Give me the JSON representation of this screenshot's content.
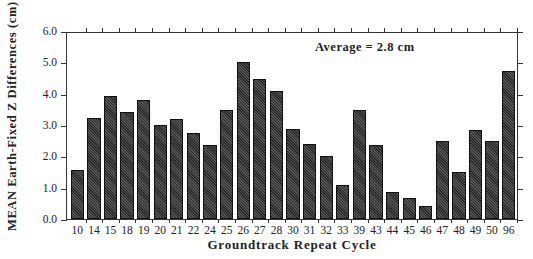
{
  "chart_data": {
    "type": "bar",
    "title": "",
    "xlabel": "Groundtrack Repeat Cycle",
    "ylabel": "MEAN Earth-Fixed Z Differences (cm)",
    "ylim": [
      0,
      6
    ],
    "yticks": [
      "0.0",
      "1.0",
      "2.0",
      "3.0",
      "4.0",
      "5.0",
      "6.0"
    ],
    "grid": false,
    "legend": null,
    "annotation": "Average = 2.8 cm",
    "categories": [
      "10",
      "14",
      "15",
      "18",
      "19",
      "20",
      "21",
      "22",
      "24",
      "25",
      "26",
      "27",
      "28",
      "30",
      "31",
      "32",
      "33",
      "39",
      "43",
      "44",
      "45",
      "46",
      "47",
      "48",
      "49",
      "50",
      "96"
    ],
    "values": [
      1.55,
      3.23,
      3.94,
      3.43,
      3.81,
      3.01,
      3.19,
      2.74,
      2.36,
      3.49,
      5.02,
      4.47,
      4.07,
      2.88,
      2.38,
      2.01,
      1.09,
      3.48,
      2.37,
      0.85,
      0.66,
      0.41,
      2.48,
      1.51,
      2.83,
      2.48,
      4.72
    ],
    "bar_color": "#3a3a3a"
  },
  "labels": {
    "ylabel": "MEAN Earth-Fixed Z Differences (cm)",
    "xlabel": "Groundtrack Repeat Cycle",
    "annotation": "Average = 2.8 cm"
  }
}
